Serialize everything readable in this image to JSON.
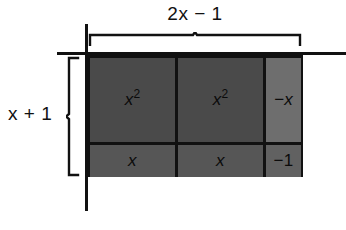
{
  "figure": {
    "type": "area-model",
    "title_top": "2x − 1",
    "title_left": "x + 1",
    "top_dimension_label": "2x − 1",
    "left_dimension_label": "x + 1",
    "colors": {
      "cell_dark": "#4a4a4a",
      "cell_mid": "#565656",
      "cell_light": "#6e6e6e",
      "cell_lightish": "#616161",
      "line": "#111111",
      "background": "#ffffff",
      "text": "#0b0b0b"
    },
    "grid": {
      "columns": 3,
      "rows": 2,
      "cells": [
        {
          "row": 0,
          "col": 0,
          "base": "x",
          "exponent": "2",
          "shade": "dark"
        },
        {
          "row": 0,
          "col": 1,
          "base": "x",
          "exponent": "2",
          "shade": "dark"
        },
        {
          "row": 0,
          "col": 2,
          "base": "−x",
          "exponent": "",
          "shade": "light"
        },
        {
          "row": 1,
          "col": 0,
          "base": "x",
          "exponent": "",
          "shade": "mid"
        },
        {
          "row": 1,
          "col": 1,
          "base": "x",
          "exponent": "",
          "shade": "mid"
        },
        {
          "row": 1,
          "col": 2,
          "base": "−1",
          "exponent": "",
          "shade": "lightish"
        }
      ]
    },
    "labels": {
      "cell_r0c0": "x²",
      "cell_r0c1": "x²",
      "cell_r0c2": "−x",
      "cell_r1c0": "x",
      "cell_r1c1": "x",
      "cell_r1c2": "−1"
    }
  }
}
